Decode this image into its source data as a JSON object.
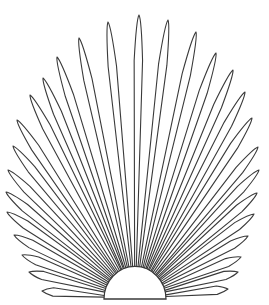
{
  "figure": {
    "title": "",
    "stroke_color": "#3a3a3a",
    "background": "#ffffff",
    "base": {
      "cx": 135,
      "cy": 299,
      "r": 31
    },
    "leaflet_tips": [
      [
        42,
        291
      ],
      [
        29,
        272
      ],
      [
        22,
        255
      ],
      [
        14,
        235
      ],
      [
        7,
        212
      ],
      [
        6,
        192
      ],
      [
        8,
        170
      ],
      [
        13,
        146
      ],
      [
        17,
        120
      ],
      [
        30,
        95
      ],
      [
        43,
        78
      ],
      [
        57,
        57
      ],
      [
        79,
        38
      ],
      [
        108,
        22
      ],
      [
        139,
        15
      ],
      [
        168,
        20
      ],
      [
        196,
        32
      ],
      [
        216,
        53
      ],
      [
        233,
        70
      ],
      [
        245,
        92
      ],
      [
        252,
        118
      ],
      [
        258,
        147
      ],
      [
        259,
        170
      ],
      [
        257,
        193
      ],
      [
        254,
        214
      ],
      [
        248,
        236
      ],
      [
        241,
        257
      ],
      [
        238,
        272
      ],
      [
        228,
        289
      ]
    ]
  }
}
